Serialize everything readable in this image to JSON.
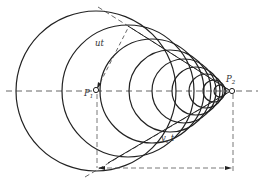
{
  "diagram": {
    "labels": {
      "wave_radius": "ut",
      "source_start": "P",
      "source_start_sub": "1",
      "source_end": "P",
      "source_end_sub": "2",
      "source_travel": "v",
      "source_travel_sub": "s",
      "source_travel_t": "t"
    },
    "colors": {
      "stroke": "#222222",
      "dashed": "#555555",
      "background": "#ffffff"
    },
    "axis_y": 91,
    "p1": [
      96,
      90
    ],
    "p2": [
      231,
      91
    ],
    "circles": [
      {
        "cx": 96,
        "r": 80
      },
      {
        "cx": 128,
        "r": 68
      },
      {
        "cx": 152,
        "r": 52
      },
      {
        "cx": 170,
        "r": 42
      },
      {
        "cx": 184,
        "r": 34
      },
      {
        "cx": 196,
        "r": 25
      },
      {
        "cx": 206,
        "r": 18
      },
      {
        "cx": 214,
        "r": 12
      },
      {
        "cx": 220,
        "r": 7
      }
    ]
  }
}
